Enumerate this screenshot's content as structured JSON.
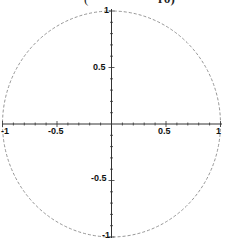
{
  "chart_data": {
    "type": "line",
    "title": "",
    "xlabel": "",
    "ylabel": "",
    "xlim": [
      -1,
      1
    ],
    "ylim": [
      -1,
      1
    ],
    "grid": false,
    "legend": null,
    "series": [
      {
        "name": "unit circle",
        "equation": "x^2 + y^2 = 1",
        "style": "dashed",
        "color": "#888888",
        "points": [
          [
            1,
            0
          ],
          [
            0.924,
            0.383
          ],
          [
            0.707,
            0.707
          ],
          [
            0.383,
            0.924
          ],
          [
            0,
            1
          ],
          [
            -0.383,
            0.924
          ],
          [
            -0.707,
            0.707
          ],
          [
            -0.924,
            0.383
          ],
          [
            -1,
            0
          ],
          [
            -0.924,
            -0.383
          ],
          [
            -0.707,
            -0.707
          ],
          [
            -0.383,
            -0.924
          ],
          [
            0,
            -1
          ],
          [
            0.383,
            -0.924
          ],
          [
            0.707,
            -0.707
          ],
          [
            0.924,
            -0.383
          ],
          [
            1,
            0
          ]
        ]
      }
    ],
    "x_ticks": [
      {
        "value": -1,
        "label": "-1"
      },
      {
        "value": -0.5,
        "label": "-0.5"
      },
      {
        "value": 0.5,
        "label": "0.5"
      },
      {
        "value": 1,
        "label": "1"
      }
    ],
    "y_ticks": [
      {
        "value": 1,
        "label": "1"
      },
      {
        "value": 0.5,
        "label": "0.5"
      },
      {
        "value": -0.5,
        "label": "-0.5"
      },
      {
        "value": -1,
        "label": "-1"
      }
    ]
  },
  "caption": {
    "left_fragment": "(",
    "right_fragment": "rθ)"
  }
}
